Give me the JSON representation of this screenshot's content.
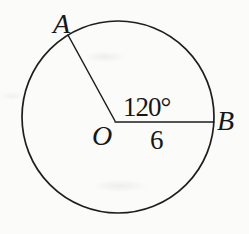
{
  "figure": {
    "labels": {
      "point_a": "A",
      "center": "O",
      "point_b": "B",
      "angle": "120°",
      "radius": "6"
    },
    "colors": {
      "line": "#1e1e1e",
      "background": "#fbfbfa"
    }
  }
}
